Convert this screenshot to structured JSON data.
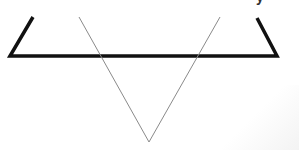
{
  "diagram": {
    "colors": {
      "thick_line": "#111111",
      "thin_line": "#8a8a8a",
      "background": "#ffffff",
      "corner_shade": "#eeeeee"
    },
    "cup": {
      "points": [
        [
          33,
          17
        ],
        [
          10,
          56
        ],
        [
          277,
          56
        ],
        [
          257,
          18
        ]
      ],
      "stroke_width": 3.5
    },
    "v_shape": {
      "points": [
        [
          79,
          17
        ],
        [
          149,
          142
        ],
        [
          220,
          17
        ]
      ],
      "stroke_width": 1
    },
    "partial_glyph": {
      "x": 258,
      "y": 0,
      "text": "y"
    }
  }
}
